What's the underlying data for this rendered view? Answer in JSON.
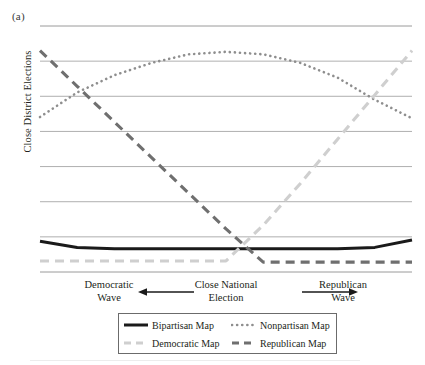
{
  "panel": {
    "label": "(a)"
  },
  "axes": {
    "y_title": "Close District Elections",
    "x_left_line1": "Democratic",
    "x_left_line2": "Wave",
    "x_center_line1": "Close National",
    "x_center_line2": "Election",
    "x_right_line1": "Republican",
    "x_right_line2": "Wave",
    "arrow_left_name": "arrow-left",
    "arrow_right_name": "arrow-right"
  },
  "legend": {
    "items": [
      {
        "label": "Bipartisan Map",
        "style": "solid",
        "color": "#1a1a1a"
      },
      {
        "label": "Nonpartisan Map",
        "style": "dotted",
        "color": "#8e8e8e"
      },
      {
        "label": "Democratic Map",
        "style": "dashed",
        "color": "#cfcfcf"
      },
      {
        "label": "Republican Map",
        "style": "dashed",
        "color": "#6f6f6f"
      }
    ]
  },
  "colors": {
    "bipartisan": "#1a1a1a",
    "nonpartisan": "#8e8e8e",
    "democratic": "#cfcfcf",
    "republican": "#6f6f6f",
    "gridline": "#9a9a9a",
    "text": "#231f20"
  },
  "chart_data": {
    "type": "line",
    "title": "",
    "xlabel": "Democratic Wave ← Close National Election → Republican Wave",
    "ylabel": "Close District Elections",
    "x": [
      0,
      1,
      2,
      3,
      4,
      5,
      6,
      7,
      8,
      9,
      10
    ],
    "xlim": [
      0,
      10
    ],
    "ylim": [
      0,
      10
    ],
    "xtick_labels": [],
    "ytick_labels": [],
    "grid": "horizontal",
    "gridline_count": 8,
    "legend_position": "below-axes",
    "annotations": [
      {
        "text": "Democratic Wave",
        "x": 0.8,
        "position": "below-axis-left"
      },
      {
        "text": "Close National Election",
        "x": 5.0,
        "position": "below-axis-center"
      },
      {
        "text": "Republican Wave",
        "x": 9.2,
        "position": "below-axis-right"
      },
      {
        "text": "←",
        "x": 2.6,
        "position": "below-axis-arrow-left"
      },
      {
        "text": "→",
        "x": 7.4,
        "position": "below-axis-arrow-right"
      }
    ],
    "series": [
      {
        "name": "Bipartisan Map",
        "style": "solid",
        "color": "#1a1a1a",
        "values": [
          1.25,
          1.0,
          0.95,
          0.95,
          0.95,
          0.95,
          0.95,
          0.95,
          0.95,
          1.0,
          1.3
        ]
      },
      {
        "name": "Nonpartisan Map",
        "style": "dotted",
        "color": "#8e8e8e",
        "values": [
          6.3,
          7.3,
          8.0,
          8.5,
          8.85,
          8.95,
          8.85,
          8.5,
          7.9,
          7.0,
          6.25
        ]
      },
      {
        "name": "Democratic Map",
        "style": "dashed",
        "color": "#cfcfcf",
        "values": [
          0.45,
          0.45,
          0.45,
          0.45,
          0.45,
          0.45,
          1.9,
          3.6,
          5.4,
          7.2,
          9.0
        ]
      },
      {
        "name": "Republican Map",
        "style": "dashed",
        "color": "#6f6f6f",
        "values": [
          9.0,
          7.55,
          6.1,
          4.65,
          3.2,
          1.75,
          0.4,
          0.4,
          0.4,
          0.4,
          0.4
        ]
      }
    ]
  }
}
